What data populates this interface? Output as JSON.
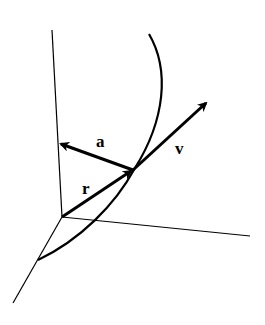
{
  "diagram": {
    "title": "",
    "labels": {
      "a": "a",
      "v": "v",
      "r": "r"
    },
    "colors": {
      "background": "#ffffff",
      "stroke": "#000000"
    },
    "elements": [
      {
        "type": "axis",
        "name": "vertical-axis"
      },
      {
        "type": "axis",
        "name": "horizontal-axis"
      },
      {
        "type": "axis",
        "name": "depth-axis"
      },
      {
        "type": "curve",
        "name": "trajectory-curve"
      },
      {
        "type": "vector",
        "name": "position-vector",
        "label": "r"
      },
      {
        "type": "vector",
        "name": "acceleration-vector",
        "label": "a"
      },
      {
        "type": "vector",
        "name": "velocity-vector",
        "label": "v"
      }
    ]
  }
}
